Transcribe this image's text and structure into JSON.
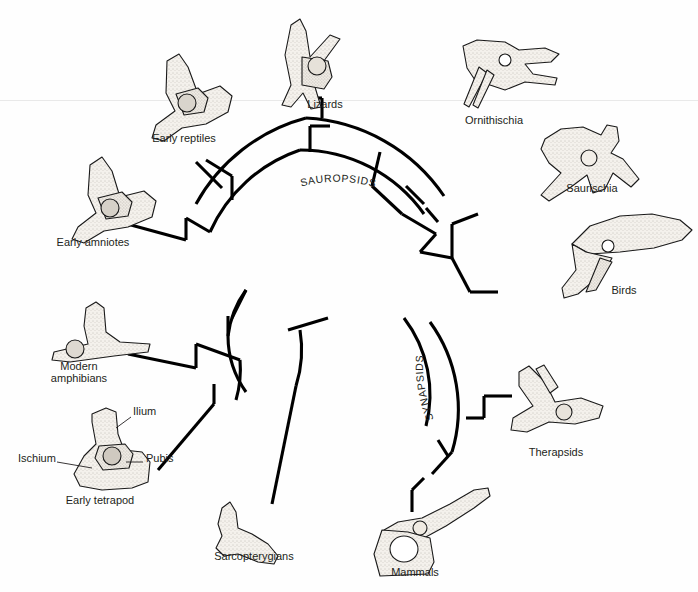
{
  "figure": {
    "type": "circular-cladogram",
    "background_color": "#fefefe",
    "line_color": "#000000",
    "text_color": "#231f20"
  },
  "clades": [
    {
      "id": "sauropsids",
      "label": "SAUROPSIDS"
    },
    {
      "id": "synapsids",
      "label": "SYNAPSIDS"
    }
  ],
  "taxa": [
    {
      "id": "early-reptiles",
      "label": "Early reptiles",
      "x": 184,
      "y": 138,
      "lines": [
        "Early reptiles"
      ]
    },
    {
      "id": "lizards",
      "label": "Lizards",
      "x": 325,
      "y": 104,
      "lines": [
        "Lizards"
      ]
    },
    {
      "id": "ornithischia",
      "label": "Ornithischia",
      "x": 494,
      "y": 120,
      "lines": [
        "Ornithischia"
      ]
    },
    {
      "id": "saurischia",
      "label": "Saurischia",
      "x": 592,
      "y": 188,
      "lines": [
        "Saurischia"
      ]
    },
    {
      "id": "birds",
      "label": "Birds",
      "x": 624,
      "y": 290,
      "lines": [
        "Birds"
      ]
    },
    {
      "id": "therapsids",
      "label": "Therapsids",
      "x": 556,
      "y": 452,
      "lines": [
        "Therapsids"
      ]
    },
    {
      "id": "mammals",
      "label": "Mammals",
      "x": 415,
      "y": 572,
      "lines": [
        "Mammals"
      ]
    },
    {
      "id": "sarcopterygians",
      "label": "Sarcopterygians",
      "x": 254,
      "y": 556,
      "lines": [
        "Sarcopterygians"
      ]
    },
    {
      "id": "early-tetrapod",
      "label": "Early tetrapod",
      "x": 100,
      "y": 500,
      "lines": [
        "Early tetrapod"
      ]
    },
    {
      "id": "modern-amphibians",
      "label": "Modern amphibians",
      "x": 79,
      "y": 366,
      "lines": [
        "Modern",
        "amphibians"
      ]
    },
    {
      "id": "early-amniotes",
      "label": "Early amniotes",
      "x": 93,
      "y": 242,
      "lines": [
        "Early amniotes"
      ]
    }
  ],
  "anatomy_labels": [
    {
      "id": "ilium",
      "label": "Ilium",
      "x": 133,
      "y": 411
    },
    {
      "id": "pubis",
      "label": "Pubis",
      "x": 146,
      "y": 458
    },
    {
      "id": "ischium",
      "label": "Ischium",
      "x": 18,
      "y": 458
    }
  ]
}
